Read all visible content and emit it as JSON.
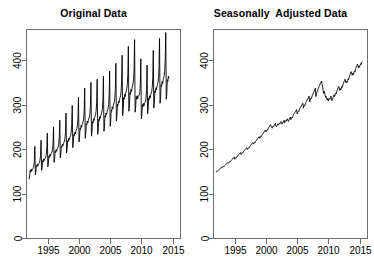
{
  "figure": {
    "background": "#ffffff",
    "line_color": "#000000",
    "axis_color": "#6b6b6b"
  },
  "panels": [
    {
      "title": "Original Data"
    },
    {
      "title": "Seasonally  Adjusted Data"
    }
  ],
  "chart_data": [
    {
      "type": "line",
      "title": "Original Data",
      "xlabel": "",
      "ylabel": "",
      "xlim": [
        1991.5,
        2016.2
      ],
      "ylim": [
        0,
        470
      ],
      "xticks": [
        1995,
        2000,
        2005,
        2010,
        2015
      ],
      "xtick_labels": [
        "1995",
        "2000",
        "2005",
        "2010",
        "2015"
      ],
      "yticks": [
        0,
        100,
        200,
        300,
        400
      ],
      "ytick_labels": [
        "0",
        "100",
        "200",
        "300",
        "400"
      ],
      "grid": false,
      "legend": "none",
      "ytick_label_rotation": -90,
      "series": [
        {
          "name": "original",
          "description": "Monthly retail-style series, 1992-01 to 2012-06, strong upward trend with regular December seasonal spikes",
          "x_start": 1992.0,
          "x_step": 0.0833333,
          "values": [
            133,
            140,
            152,
            148,
            155,
            150,
            154,
            156,
            158,
            162,
            172,
            206,
            142,
            148,
            163,
            160,
            166,
            162,
            166,
            168,
            170,
            175,
            186,
            220,
            152,
            158,
            174,
            171,
            178,
            174,
            178,
            180,
            182,
            188,
            200,
            236,
            160,
            167,
            184,
            181,
            188,
            184,
            189,
            191,
            193,
            199,
            212,
            250,
            170,
            177,
            195,
            192,
            199,
            195,
            200,
            202,
            205,
            211,
            225,
            265,
            180,
            188,
            207,
            204,
            211,
            207,
            212,
            215,
            218,
            224,
            239,
            281,
            191,
            199,
            219,
            216,
            224,
            220,
            225,
            228,
            231,
            238,
            254,
            298,
            203,
            212,
            233,
            230,
            238,
            234,
            240,
            243,
            246,
            253,
            270,
            317,
            216,
            225,
            247,
            244,
            253,
            249,
            255,
            258,
            262,
            269,
            287,
            337,
            224,
            234,
            257,
            254,
            263,
            259,
            265,
            269,
            272,
            280,
            298,
            350,
            229,
            239,
            262,
            259,
            268,
            264,
            271,
            274,
            278,
            286,
            305,
            357,
            233,
            243,
            267,
            264,
            273,
            269,
            276,
            279,
            283,
            291,
            310,
            364,
            240,
            250,
            275,
            272,
            281,
            277,
            284,
            288,
            292,
            300,
            320,
            375,
            251,
            262,
            288,
            285,
            295,
            290,
            298,
            302,
            306,
            315,
            336,
            393,
            263,
            274,
            301,
            298,
            308,
            304,
            311,
            316,
            320,
            329,
            351,
            411,
            275,
            287,
            316,
            312,
            323,
            318,
            326,
            331,
            336,
            345,
            368,
            431,
            285,
            297,
            327,
            323,
            334,
            329,
            337,
            342,
            347,
            357,
            380,
            446,
            283,
            292,
            318,
            312,
            320,
            313,
            318,
            320,
            322,
            327,
            345,
            403,
            268,
            276,
            300,
            295,
            303,
            297,
            302,
            305,
            308,
            314,
            332,
            389,
            279,
            289,
            315,
            311,
            320,
            315,
            322,
            326,
            330,
            339,
            360,
            422,
            292,
            303,
            331,
            327,
            338,
            333,
            340,
            345,
            350,
            360,
            383,
            449,
            303,
            315,
            345,
            341,
            352,
            347,
            356,
            361,
            366,
            377,
            401,
            462,
            312,
            325,
            356,
            352,
            364,
            359
          ]
        }
      ]
    },
    {
      "type": "line",
      "title": "Seasonally  Adjusted Data",
      "xlabel": "",
      "ylabel": "",
      "xlim": [
        1991.5,
        2016.2
      ],
      "ylim": [
        0,
        470
      ],
      "xticks": [
        1995,
        2000,
        2005,
        2010,
        2015
      ],
      "xtick_labels": [
        "1995",
        "2000",
        "2005",
        "2010",
        "2015"
      ],
      "yticks": [
        0,
        100,
        200,
        300,
        400
      ],
      "ytick_labels": [
        "0",
        "100",
        "200",
        "300",
        "400"
      ],
      "grid": false,
      "legend": "none",
      "ytick_label_rotation": -90,
      "series": [
        {
          "name": "seasonally-adjusted",
          "description": "Same series with seasonal component removed: smooth upward trend, plateau near 2000, 2008 recession dip, recovery to ~395 by 2014",
          "x_start": 1992.0,
          "x_step": 0.0833333,
          "values": [
            148,
            149,
            151,
            150,
            152,
            153,
            154,
            155,
            157,
            158,
            159,
            160,
            158,
            159,
            161,
            160,
            162,
            163,
            164,
            166,
            167,
            168,
            169,
            170,
            168,
            170,
            172,
            171,
            173,
            174,
            176,
            177,
            178,
            180,
            181,
            182,
            177,
            179,
            181,
            180,
            182,
            184,
            185,
            187,
            188,
            189,
            191,
            192,
            188,
            190,
            192,
            191,
            193,
            195,
            196,
            198,
            199,
            200,
            202,
            203,
            199,
            201,
            203,
            202,
            204,
            206,
            208,
            209,
            211,
            212,
            214,
            215,
            211,
            213,
            215,
            214,
            217,
            219,
            220,
            222,
            224,
            225,
            227,
            228,
            224,
            226,
            229,
            228,
            231,
            233,
            234,
            236,
            238,
            240,
            241,
            243,
            239,
            241,
            244,
            243,
            246,
            248,
            250,
            252,
            254,
            255,
            251,
            248,
            247,
            250,
            252,
            251,
            254,
            256,
            258,
            253,
            250,
            252,
            255,
            257,
            254,
            256,
            258,
            257,
            260,
            262,
            259,
            256,
            258,
            261,
            263,
            265,
            259,
            262,
            264,
            263,
            266,
            268,
            265,
            262,
            265,
            268,
            270,
            272,
            266,
            269,
            272,
            271,
            274,
            277,
            279,
            281,
            283,
            285,
            287,
            289,
            279,
            282,
            285,
            284,
            288,
            291,
            293,
            295,
            297,
            299,
            301,
            303,
            292,
            296,
            299,
            298,
            302,
            305,
            307,
            310,
            312,
            314,
            317,
            319,
            306,
            310,
            314,
            313,
            317,
            320,
            323,
            326,
            328,
            331,
            334,
            337,
            318,
            322,
            327,
            330,
            334,
            337,
            340,
            343,
            346,
            348,
            351,
            353,
            345,
            340,
            332,
            325,
            330,
            326,
            320,
            316,
            318,
            314,
            310,
            314,
            308,
            311,
            314,
            312,
            316,
            319,
            313,
            309,
            312,
            316,
            319,
            322,
            318,
            322,
            326,
            324,
            328,
            332,
            335,
            338,
            341,
            337,
            332,
            336,
            333,
            337,
            341,
            339,
            344,
            348,
            351,
            354,
            357,
            353,
            349,
            353,
            350,
            354,
            358,
            356,
            361,
            365,
            368,
            371,
            374,
            370,
            366,
            370,
            367,
            371,
            375,
            373,
            378,
            382,
            385,
            388,
            391,
            387,
            383,
            387,
            384,
            388,
            392,
            390,
            395,
            396
          ]
        }
      ]
    }
  ]
}
